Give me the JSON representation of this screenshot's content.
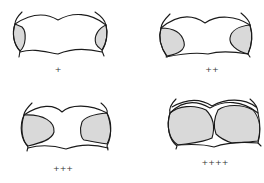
{
  "colors": {
    "outline": "#1a1a1a",
    "fill": "#d9d9d9",
    "background": "#ffffff"
  },
  "panels": [
    {
      "label": "+",
      "grade": 1
    },
    {
      "label": "++",
      "grade": 2
    },
    {
      "label": "+++",
      "grade": 3
    },
    {
      "label": "++++",
      "grade": 4
    }
  ]
}
